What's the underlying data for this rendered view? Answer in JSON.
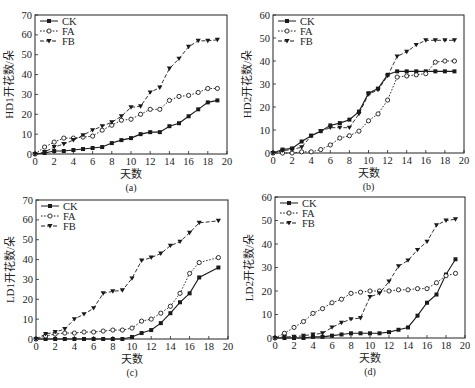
{
  "figure": {
    "panels": [
      "a",
      "b",
      "c",
      "d"
    ]
  },
  "colors": {
    "line": "#1a1a1a",
    "axis": "#222222",
    "background": "#ffffff"
  },
  "chart_data": [
    {
      "id": "a",
      "type": "line",
      "panel_label": "(a)",
      "title": "",
      "xlabel": "天数",
      "ylabel": "HD1开花数/朵",
      "xlim": [
        0,
        20
      ],
      "ylim": [
        0,
        70
      ],
      "xticks": [
        0,
        2,
        4,
        6,
        8,
        10,
        12,
        14,
        16,
        18,
        20
      ],
      "yticks": [
        0,
        10,
        20,
        30,
        40,
        50,
        60,
        70
      ],
      "grid": false,
      "legend_position": "upper left",
      "x": [
        0,
        1,
        2,
        3,
        4,
        5,
        6,
        7,
        8,
        9,
        10,
        11,
        12,
        13,
        14,
        15,
        16,
        17,
        18,
        19
      ],
      "series": [
        {
          "name": "CK",
          "marker": "filled-square",
          "dash": "solid",
          "values": [
            0,
            0.5,
            1.5,
            1.5,
            2,
            2.5,
            3,
            3.5,
            5.5,
            7,
            8,
            10,
            11,
            11,
            14,
            15.5,
            19,
            22.5,
            26,
            27
          ]
        },
        {
          "name": "FA",
          "marker": "open-circle",
          "dash": "dotted",
          "values": [
            0,
            3.5,
            6,
            8,
            8,
            8.5,
            9,
            12,
            14.5,
            17,
            17.5,
            20,
            22.5,
            22.5,
            27,
            29,
            29.5,
            31,
            33,
            33
          ]
        },
        {
          "name": "FB",
          "marker": "filled-triangle-down",
          "dash": "dashed",
          "values": [
            0,
            1,
            3.5,
            5,
            7,
            9.5,
            12,
            14,
            16,
            19,
            23.5,
            24,
            31,
            33.5,
            43,
            48,
            54,
            57,
            57,
            57.5
          ]
        }
      ]
    },
    {
      "id": "b",
      "type": "line",
      "panel_label": "(b)",
      "title": "",
      "xlabel": "天数",
      "ylabel": "HD2开花数/朵",
      "xlim": [
        0,
        20
      ],
      "ylim": [
        0,
        60
      ],
      "xticks": [
        0,
        2,
        4,
        6,
        8,
        10,
        12,
        14,
        16,
        18,
        20
      ],
      "yticks": [
        0,
        10,
        20,
        30,
        40,
        50,
        60
      ],
      "grid": false,
      "legend_position": "upper left",
      "x": [
        0,
        1,
        2,
        3,
        4,
        5,
        6,
        7,
        8,
        9,
        10,
        11,
        12,
        13,
        14,
        15,
        16,
        17,
        18,
        19
      ],
      "series": [
        {
          "name": "CK",
          "marker": "filled-square",
          "dash": "solid",
          "values": [
            0,
            1.5,
            2,
            5,
            7.5,
            9.5,
            12,
            13,
            14.5,
            18,
            26,
            28,
            34,
            35.5,
            35.5,
            35.5,
            35.5,
            35.5,
            35.5,
            35.5
          ]
        },
        {
          "name": "FA",
          "marker": "open-circle",
          "dash": "dotted",
          "values": [
            0,
            0,
            0,
            0.5,
            0.5,
            1.5,
            3.5,
            6.5,
            7.5,
            9.5,
            14,
            17,
            23,
            33,
            33.5,
            34,
            34.5,
            39.5,
            40,
            40
          ]
        },
        {
          "name": "FB",
          "marker": "filled-triangle-down",
          "dash": "dashed",
          "values": [
            0,
            1,
            1.5,
            2.5,
            7.5,
            9.5,
            11,
            11,
            11,
            17,
            25.5,
            27.5,
            33.5,
            42,
            44,
            47,
            49,
            49,
            49,
            49
          ]
        }
      ]
    },
    {
      "id": "c",
      "type": "line",
      "panel_label": "(c)",
      "title": "",
      "xlabel": "天数",
      "ylabel": "LD1开花数/朵",
      "xlim": [
        0,
        20
      ],
      "ylim": [
        0,
        70
      ],
      "xticks": [
        0,
        2,
        4,
        6,
        8,
        10,
        12,
        14,
        16,
        18,
        20
      ],
      "yticks": [
        0,
        10,
        20,
        30,
        40,
        50,
        60,
        70
      ],
      "grid": false,
      "legend_position": "upper left",
      "x": [
        0,
        1,
        2,
        3,
        4,
        5,
        6,
        7,
        8,
        9,
        10,
        11,
        12,
        13,
        14,
        15,
        16,
        17,
        19
      ],
      "series": [
        {
          "name": "CK",
          "marker": "filled-square",
          "dash": "solid",
          "values": [
            0,
            0,
            0,
            0,
            0,
            0,
            0,
            0,
            0,
            0,
            1,
            3,
            4.5,
            8,
            13,
            18.5,
            23,
            31,
            36
          ]
        },
        {
          "name": "FA",
          "marker": "open-circle",
          "dash": "dotted",
          "values": [
            0,
            1.5,
            2.5,
            3,
            3,
            3.5,
            3.5,
            4,
            4.5,
            4.5,
            5.5,
            9,
            10,
            13,
            16.5,
            23,
            33,
            38.5,
            41
          ]
        },
        {
          "name": "FB",
          "marker": "filled-triangle-down",
          "dash": "dashed",
          "values": [
            0,
            2.5,
            3.5,
            5,
            10,
            12.5,
            15.5,
            23,
            24,
            24.5,
            30.5,
            39.5,
            41,
            43,
            47,
            49,
            53.5,
            58.5,
            59.5
          ]
        }
      ]
    },
    {
      "id": "d",
      "type": "line",
      "panel_label": "(d)",
      "title": "",
      "xlabel": "天数",
      "ylabel": "LD2开花数/朵",
      "xlim": [
        0,
        20
      ],
      "ylim": [
        0,
        60
      ],
      "xticks": [
        0,
        2,
        4,
        6,
        8,
        10,
        12,
        14,
        16,
        18,
        20
      ],
      "yticks": [
        0,
        10,
        20,
        30,
        40,
        50,
        60
      ],
      "grid": false,
      "legend_position": "upper left",
      "x": [
        0,
        1,
        2,
        3,
        4,
        5,
        6,
        7,
        8,
        9,
        10,
        11,
        12,
        13,
        14,
        15,
        16,
        17,
        18,
        19
      ],
      "series": [
        {
          "name": "CK",
          "marker": "filled-square",
          "dash": "solid",
          "values": [
            0,
            0,
            0,
            0,
            0.5,
            0.5,
            1,
            1.5,
            2,
            2,
            2,
            2,
            2.5,
            3.5,
            4.5,
            9.5,
            15,
            18.5,
            27,
            33.5
          ]
        },
        {
          "name": "FA",
          "marker": "open-circle",
          "dash": "dotted",
          "values": [
            0,
            2,
            4.5,
            7,
            10.5,
            12.5,
            15,
            16.5,
            19,
            19.5,
            20,
            20,
            20,
            20.5,
            20.5,
            21,
            21,
            23.5,
            26.5,
            27.5
          ]
        },
        {
          "name": "FB",
          "marker": "filled-triangle-down",
          "dash": "dashed",
          "values": [
            0,
            0.5,
            0.5,
            1,
            1.5,
            2,
            4.5,
            6.5,
            8,
            8.5,
            17.5,
            19,
            24,
            30.5,
            33,
            37.5,
            41,
            48,
            50,
            50.5
          ]
        }
      ]
    }
  ]
}
